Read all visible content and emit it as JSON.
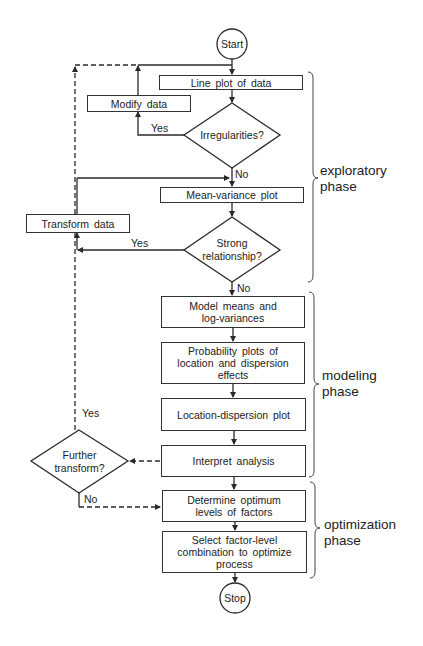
{
  "nodes": {
    "start": "Start",
    "line_plot": "Line plot of data",
    "modify": "Modify data",
    "irregularities": "Irregularities?",
    "mean_variance": "Mean-variance plot",
    "transform": "Transform data",
    "strong_rel_1": "Strong",
    "strong_rel_2": "relationship?",
    "model_1": "Model means and",
    "model_2": "log-variances",
    "prob_1": "Probability plots of",
    "prob_2": "location and dispersion",
    "prob_3": "effects",
    "location": "Location-dispersion plot",
    "interpret": "Interpret analysis",
    "further_1": "Further",
    "further_2": "transform?",
    "determine_1": "Determine optimum",
    "determine_2": "levels of factors",
    "select_1": "Select factor-level",
    "select_2": "combination to optimize",
    "select_3": "process",
    "stop": "Stop"
  },
  "edge_labels": {
    "irreg_yes": "Yes",
    "irreg_no": "No",
    "strong_yes": "Yes",
    "strong_no": "No",
    "further_yes": "Yes",
    "further_no": "No"
  },
  "phases": {
    "exploratory_1": "exploratory",
    "exploratory_2": "phase",
    "modeling_1": "modeling",
    "modeling_2": "phase",
    "optimization_1": "optimization",
    "optimization_2": "phase"
  },
  "colors": {
    "line": "#2a2a2a",
    "text": "#222222",
    "background": "#ffffff"
  }
}
